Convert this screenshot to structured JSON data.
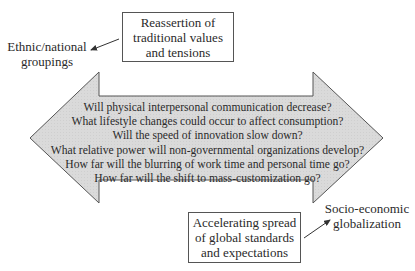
{
  "diagram": {
    "top_box": {
      "lines": [
        "Reassertion of",
        "traditional values",
        "and tensions"
      ]
    },
    "left_label": {
      "lines": [
        "Ethnic/national",
        "groupings"
      ]
    },
    "bottom_box": {
      "lines": [
        "Accelerating spread",
        "of global standards",
        "and expectations"
      ]
    },
    "right_label": {
      "lines": [
        "Socio-economic",
        "globalization"
      ]
    },
    "double_arrow": {
      "fill": "#d9d9d9",
      "stroke": "#555555",
      "questions": [
        "Will physical interpersonal communication decrease?",
        "What lifestyle changes could occur to affect consumption?",
        "Will the speed of innovation slow down?",
        "What relative power will non-governmental organizations develop?",
        "How far will the blurring of work time and personal time go?",
        "How far will the shift to mass-customization go?"
      ]
    }
  }
}
